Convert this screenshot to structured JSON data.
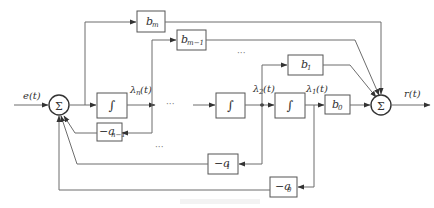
{
  "diagram": {
    "input": {
      "label": "e(t)"
    },
    "output": {
      "label": "r(t)"
    },
    "summers": [
      {
        "id": "sum-left",
        "symbol": "Σ"
      },
      {
        "id": "sum-right",
        "symbol": "Σ"
      }
    ],
    "integrators": [
      {
        "id": "int-n",
        "symbol": "∫",
        "output_state": "λ",
        "output_sub": "n",
        "output_arg": "(t)"
      },
      {
        "id": "int-2",
        "symbol": "∫",
        "output_state": "λ",
        "output_sub": "2",
        "output_arg": "(t)"
      },
      {
        "id": "int-1",
        "symbol": "∫",
        "output_state": "λ",
        "output_sub": "1",
        "output_arg": "(t)"
      }
    ],
    "forward_gains": [
      {
        "id": "b-m",
        "main": "b",
        "sub": "m"
      },
      {
        "id": "b-m-1",
        "main": "b",
        "sub": "m−1"
      },
      {
        "id": "b-1",
        "main": "b",
        "sub": "1"
      },
      {
        "id": "b-0",
        "main": "b",
        "sub": "0"
      }
    ],
    "feedback_gains": [
      {
        "id": "a-n-1",
        "main": "−a",
        "sub": "n−1"
      },
      {
        "id": "a-1",
        "main": "−a",
        "sub": "1"
      },
      {
        "id": "a-0",
        "main": "−a",
        "sub": "0"
      }
    ],
    "ellipsis": "···"
  },
  "colors": {
    "line": "#6d6d6d",
    "box_border": "#555555",
    "text": "#333333",
    "background": "#ffffff"
  }
}
